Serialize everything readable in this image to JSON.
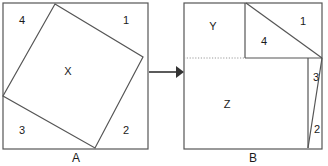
{
  "figure": {
    "stroke_color": "#555555",
    "dotted_color": "#999999",
    "background_color": "#ffffff",
    "text_color": "#1a1a1a"
  },
  "panel_a": {
    "caption": "A",
    "caption_x": 76,
    "caption_y": 159,
    "outer_square": {
      "x": 3,
      "y": 3,
      "width": 145,
      "height": 146
    },
    "tilted_square_points": "55,4 143,57 95,148 3,96",
    "labels": [
      {
        "name": "region-label-4",
        "text": "4",
        "x": 22,
        "y": 21
      },
      {
        "name": "region-label-1",
        "text": "1",
        "x": 126,
        "y": 21
      },
      {
        "name": "region-label-x",
        "text": "X",
        "x": 68,
        "y": 72
      },
      {
        "name": "region-label-3",
        "text": "3",
        "x": 22,
        "y": 131
      },
      {
        "name": "region-label-2",
        "text": "2",
        "x": 126,
        "y": 131
      }
    ]
  },
  "arrow": {
    "name": "transform-arrow",
    "x1": 149,
    "y1": 72,
    "x2": 176,
    "y2": 72,
    "head_points": "176,66 184,72 176,78"
  },
  "panel_b": {
    "caption": "B",
    "caption_x": 253,
    "caption_y": 159,
    "outer_square": {
      "x": 184,
      "y": 3,
      "width": 138,
      "height": 146
    },
    "segments": [
      {
        "name": "divider-vertical-upper",
        "x1": 245,
        "y1": 3,
        "x2": 245,
        "y2": 58
      },
      {
        "name": "divider-diagonal-top",
        "x1": 246,
        "y1": 3,
        "x2": 322,
        "y2": 58
      },
      {
        "name": "divider-horizontal-mid",
        "x1": 245,
        "y1": 58,
        "x2": 322,
        "y2": 58
      },
      {
        "name": "divider-vertical-lower",
        "x1": 308,
        "y1": 58,
        "x2": 308,
        "y2": 148
      },
      {
        "name": "divider-diagonal-bottom",
        "x1": 308,
        "y1": 148,
        "x2": 322,
        "y2": 58
      }
    ],
    "dotted_segment": {
      "name": "dotted-guide-line",
      "x1": 184,
      "y1": 58,
      "x2": 245,
      "y2": 58
    },
    "labels": [
      {
        "name": "region-label-y",
        "text": "Y",
        "x": 213,
        "y": 27
      },
      {
        "name": "region-label-1",
        "text": "1",
        "x": 303,
        "y": 22
      },
      {
        "name": "region-label-4",
        "text": "4",
        "x": 264,
        "y": 42
      },
      {
        "name": "region-label-3",
        "text": "3",
        "x": 316,
        "y": 78
      },
      {
        "name": "region-label-z",
        "text": "Z",
        "x": 227,
        "y": 105
      },
      {
        "name": "region-label-2",
        "text": "2",
        "x": 317,
        "y": 130
      }
    ]
  }
}
